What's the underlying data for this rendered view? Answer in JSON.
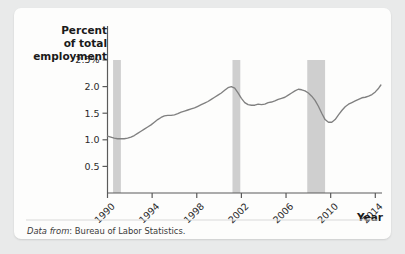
{
  "figure": {
    "background_color": "#e9eaea",
    "card_color": "#fdfdfc",
    "line_color": "#808080",
    "recession_band_color": "#cfcfcf"
  },
  "axis_titles": {
    "y_line1": "Percent",
    "y_line2": "of total",
    "y_line3": "employment",
    "x": "Year"
  },
  "source": {
    "prefix": "Data from",
    "text": ": Bureau of Labor Statistics."
  },
  "chart_data": {
    "type": "line",
    "title": "",
    "subtitle": "",
    "xlabel": "Year",
    "ylabel": "Percent of total employment",
    "xlim": [
      1990,
      2014.6
    ],
    "ylim": [
      0,
      2.5
    ],
    "grid": false,
    "legend": null,
    "ytick_labels": [
      "2.5%",
      "2.0",
      "1.5",
      "1.0",
      "0.5"
    ],
    "ytick_values": [
      2.5,
      2.0,
      1.5,
      1.0,
      0.5
    ],
    "xtick_labels": [
      "1990",
      "1994",
      "1998",
      "2002",
      "2006",
      "2010",
      "2014"
    ],
    "xtick_values": [
      1990,
      1994,
      1998,
      2002,
      2006,
      2010,
      2014
    ],
    "xtick_rotation_deg": 45,
    "shaded_regions": [
      {
        "label": "recession-1990",
        "x0": 1990.5,
        "x1": 1991.2
      },
      {
        "label": "recession-2001",
        "x0": 2001.2,
        "x1": 2001.9
      },
      {
        "label": "recession-2008",
        "x0": 2007.9,
        "x1": 2009.5
      }
    ],
    "series": [
      {
        "name": "Temporary help services share of total employment",
        "color": "#808080",
        "x": [
          1990.0,
          1990.3,
          1990.6,
          1990.9,
          1991.2,
          1991.5,
          1991.8,
          1992.1,
          1992.4,
          1992.7,
          1993.0,
          1993.3,
          1993.6,
          1993.9,
          1994.2,
          1994.5,
          1994.8,
          1995.1,
          1995.4,
          1995.7,
          1996.0,
          1996.3,
          1996.6,
          1996.9,
          1997.2,
          1997.5,
          1997.8,
          1998.1,
          1998.4,
          1998.7,
          1999.0,
          1999.3,
          1999.6,
          1999.9,
          2000.2,
          2000.5,
          2000.8,
          2001.1,
          2001.4,
          2001.7,
          2002.0,
          2002.3,
          2002.6,
          2002.9,
          2003.2,
          2003.5,
          2003.8,
          2004.1,
          2004.4,
          2004.7,
          2005.0,
          2005.3,
          2005.6,
          2005.9,
          2006.2,
          2006.5,
          2006.8,
          2007.1,
          2007.4,
          2007.7,
          2008.0,
          2008.3,
          2008.6,
          2008.9,
          2009.2,
          2009.5,
          2009.8,
          2010.1,
          2010.4,
          2010.7,
          2011.0,
          2011.3,
          2011.6,
          2011.9,
          2012.2,
          2012.5,
          2012.8,
          2013.1,
          2013.4,
          2013.7,
          2014.0,
          2014.3,
          2014.5
        ],
        "y": [
          1.07,
          1.05,
          1.03,
          1.02,
          1.02,
          1.02,
          1.03,
          1.05,
          1.08,
          1.12,
          1.16,
          1.2,
          1.24,
          1.28,
          1.33,
          1.38,
          1.42,
          1.45,
          1.46,
          1.46,
          1.47,
          1.49,
          1.52,
          1.54,
          1.56,
          1.58,
          1.6,
          1.63,
          1.66,
          1.69,
          1.72,
          1.76,
          1.8,
          1.84,
          1.88,
          1.93,
          1.98,
          2.0,
          1.97,
          1.88,
          1.78,
          1.7,
          1.66,
          1.65,
          1.65,
          1.67,
          1.66,
          1.67,
          1.7,
          1.71,
          1.73,
          1.76,
          1.78,
          1.8,
          1.84,
          1.88,
          1.92,
          1.95,
          1.94,
          1.92,
          1.88,
          1.82,
          1.74,
          1.63,
          1.5,
          1.38,
          1.33,
          1.33,
          1.38,
          1.47,
          1.55,
          1.62,
          1.67,
          1.7,
          1.73,
          1.76,
          1.79,
          1.8,
          1.82,
          1.85,
          1.9,
          1.97,
          2.03
        ]
      }
    ]
  }
}
